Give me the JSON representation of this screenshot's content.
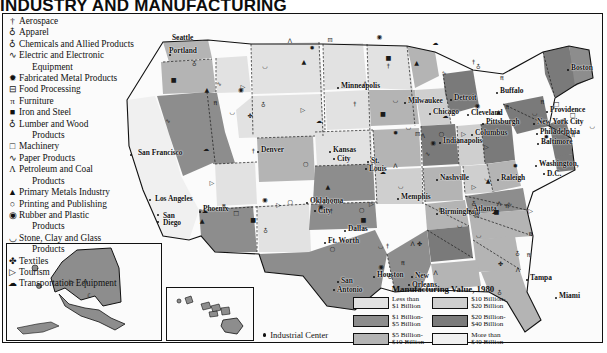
{
  "title": "INDUSTRY AND MANUFACTURING",
  "symbol_legend": {
    "items": [
      {
        "glyph": "†",
        "label": "Aerospace",
        "icon": "aerospace-icon"
      },
      {
        "glyph": "♁",
        "label": "Apparel",
        "icon": "apparel-icon"
      },
      {
        "glyph": "♁",
        "label": "Chemicals and Allied Products",
        "icon": "chemicals-icon"
      },
      {
        "glyph": "∿",
        "label": "Electric and Electronic",
        "icon": "electronics-icon"
      },
      {
        "glyph": "",
        "label": "Equipment",
        "icon": "electronics-cont",
        "indent": true
      },
      {
        "glyph": "✹",
        "label": "Fabricated Metal Products",
        "icon": "fabricated-metal-icon"
      },
      {
        "glyph": "⊟",
        "label": "Food Processing",
        "icon": "food-processing-icon"
      },
      {
        "glyph": "π",
        "label": "Furniture",
        "icon": "furniture-icon"
      },
      {
        "glyph": "■",
        "label": "Iron and Steel",
        "icon": "iron-steel-icon"
      },
      {
        "glyph": "♁",
        "label": "Lumber and Wood",
        "icon": "lumber-wood-icon"
      },
      {
        "glyph": "",
        "label": "Products",
        "icon": "lumber-cont",
        "indent": true
      },
      {
        "glyph": "□",
        "label": "Machinery",
        "icon": "machinery-icon"
      },
      {
        "glyph": "∿",
        "label": "Paper Products",
        "icon": "paper-products-icon"
      },
      {
        "glyph": "Λ",
        "label": "Petroleum and Coal",
        "icon": "petroleum-coal-icon"
      },
      {
        "glyph": "",
        "label": "Products",
        "icon": "petroleum-cont",
        "indent": true
      },
      {
        "glyph": "▲",
        "label": "Primary Metals Industry",
        "icon": "primary-metals-icon"
      },
      {
        "glyph": "○",
        "label": "Printing and Publishing",
        "icon": "printing-publishing-icon"
      },
      {
        "glyph": "◉",
        "label": "Rubber and Plastic",
        "icon": "rubber-plastic-icon"
      },
      {
        "glyph": "",
        "label": "Products",
        "icon": "rubber-cont",
        "indent": true
      },
      {
        "glyph": "◡",
        "label": "Stone, Clay and Glass",
        "icon": "stone-clay-glass-icon"
      },
      {
        "glyph": "",
        "label": "Products",
        "icon": "stone-cont",
        "indent": true
      },
      {
        "glyph": "✤",
        "label": "Textiles",
        "icon": "textiles-icon"
      },
      {
        "glyph": "▷",
        "label": "Tourism",
        "icon": "tourism-icon"
      },
      {
        "glyph": "☁",
        "label": "Transportation Equipment",
        "icon": "transportation-equipment-icon"
      }
    ]
  },
  "industrial_center": {
    "label": "Industrial Center",
    "marker": "dot"
  },
  "value_legend": {
    "title": "Manufacturing Value, 1980",
    "column_left": [
      {
        "line1": "Less than",
        "line2": "$1 Billion",
        "color": "#e2e2e2"
      },
      {
        "line1": "$1 Billion-",
        "line2": "$5 Billion",
        "color": "#8d8d8d"
      },
      {
        "line1": "$5 Billion-",
        "line2": "$10 Billion",
        "color": "#b4b4b4"
      }
    ],
    "column_right": [
      {
        "line1": "$10 Billion-",
        "line2": "$20 Billion",
        "color": "#cfcfcf"
      },
      {
        "line1": "$20 Billion-",
        "line2": "$40 Billion",
        "color": "#7a7a7a"
      },
      {
        "line1": "More than",
        "line2": "$40 Billion",
        "color": "#f0f0f0"
      }
    ]
  },
  "cities": [
    {
      "name": "Seattle",
      "x": 178,
      "y": 38,
      "dx": -9,
      "dy": 0
    },
    {
      "name": "Portland",
      "x": 170,
      "y": 55,
      "dx": -4,
      "dy": -4
    },
    {
      "name": "San Francisco",
      "x": 131,
      "y": 155,
      "dx": 4,
      "dy": -2
    },
    {
      "name": "Los Angeles",
      "x": 150,
      "y": 200,
      "dx": 2,
      "dy": -1
    },
    {
      "name": "San",
      "x": 158,
      "y": 215,
      "dx": 2,
      "dy": 1
    },
    {
      "name": "Diego",
      "x": 158,
      "y": 222,
      "dx": 2,
      "dy": 1
    },
    {
      "name": "Phoenix",
      "x": 200,
      "y": 212,
      "dx": 0,
      "dy": -3
    },
    {
      "name": "Denver",
      "x": 258,
      "y": 152,
      "dx": 0,
      "dy": -2
    },
    {
      "name": "Minneapolis",
      "x": 338,
      "y": 88,
      "dx": 0,
      "dy": -2
    },
    {
      "name": "Milwaukee",
      "x": 405,
      "y": 103,
      "dx": 0,
      "dy": -2
    },
    {
      "name": "Chicago",
      "x": 430,
      "y": 114,
      "dx": 0,
      "dy": -2
    },
    {
      "name": "Kansas",
      "x": 330,
      "y": 152,
      "dx": 0,
      "dy": -2
    },
    {
      "name": "City",
      "x": 334,
      "y": 159,
      "dx": 0,
      "dy": 0
    },
    {
      "name": "St.",
      "x": 368,
      "y": 162,
      "dx": 0,
      "dy": -1
    },
    {
      "name": "Louis",
      "x": 366,
      "y": 169,
      "dx": 0,
      "dy": 0
    },
    {
      "name": "Indianapolis",
      "x": 440,
      "y": 143,
      "dx": 0,
      "dy": -2
    },
    {
      "name": "Columbus",
      "x": 472,
      "y": 135,
      "dx": 0,
      "dy": -2
    },
    {
      "name": "Detroit",
      "x": 451,
      "y": 100,
      "dx": 0,
      "dy": -2
    },
    {
      "name": "Cleveland",
      "x": 468,
      "y": 115,
      "dx": 0,
      "dy": -2
    },
    {
      "name": "Buffalo",
      "x": 497,
      "y": 93,
      "dx": 0,
      "dy": -2
    },
    {
      "name": "Pittsburgh",
      "x": 483,
      "y": 124,
      "dx": 0,
      "dy": -2
    },
    {
      "name": "Boston",
      "x": 568,
      "y": 70,
      "dx": 0,
      "dy": -2
    },
    {
      "name": "Providence",
      "x": 547,
      "y": 112,
      "dx": 0,
      "dy": -2
    },
    {
      "name": "New York City",
      "x": 534,
      "y": 124,
      "dx": 0,
      "dy": -2
    },
    {
      "name": "Philadelphia",
      "x": 537,
      "y": 134,
      "dx": 0,
      "dy": -2
    },
    {
      "name": "Baltimore",
      "x": 538,
      "y": 144,
      "dx": 0,
      "dy": -2
    },
    {
      "name": "Washington,",
      "x": 536,
      "y": 166,
      "dx": 0,
      "dy": -2
    },
    {
      "name": "D.C.",
      "x": 544,
      "y": 174,
      "dx": 0,
      "dy": 0
    },
    {
      "name": "Raleigh",
      "x": 498,
      "y": 180,
      "dx": 0,
      "dy": -2
    },
    {
      "name": "Nashville",
      "x": 437,
      "y": 180,
      "dx": 0,
      "dy": -2
    },
    {
      "name": "Memphis",
      "x": 398,
      "y": 199,
      "dx": 0,
      "dy": -2
    },
    {
      "name": "Birmingham",
      "x": 437,
      "y": 214,
      "dx": 0,
      "dy": -2
    },
    {
      "name": "Atlanta",
      "x": 470,
      "y": 211,
      "dx": 0,
      "dy": -2
    },
    {
      "name": "Tampa",
      "x": 527,
      "y": 280,
      "dx": 0,
      "dy": -2
    },
    {
      "name": "Miami",
      "x": 556,
      "y": 298,
      "dx": 0,
      "dy": -2
    },
    {
      "name": "Oklahoma",
      "x": 307,
      "y": 203,
      "dx": 0,
      "dy": -2
    },
    {
      "name": "City",
      "x": 315,
      "y": 211,
      "dx": 0,
      "dy": 0
    },
    {
      "name": "Dallas",
      "x": 345,
      "y": 231,
      "dx": 0,
      "dy": -2
    },
    {
      "name": "Ft. Worth",
      "x": 325,
      "y": 243,
      "dx": 0,
      "dy": -2
    },
    {
      "name": "Houston",
      "x": 374,
      "y": 277,
      "dx": 0,
      "dy": -2
    },
    {
      "name": "San",
      "x": 338,
      "y": 282,
      "dx": 0,
      "dy": -1
    },
    {
      "name": "Antonio",
      "x": 334,
      "y": 290,
      "dx": 0,
      "dy": 0
    },
    {
      "name": "New",
      "x": 412,
      "y": 277,
      "dx": 0,
      "dy": -1
    },
    {
      "name": "Orleans",
      "x": 409,
      "y": 285,
      "dx": 0,
      "dy": 0
    }
  ]
}
